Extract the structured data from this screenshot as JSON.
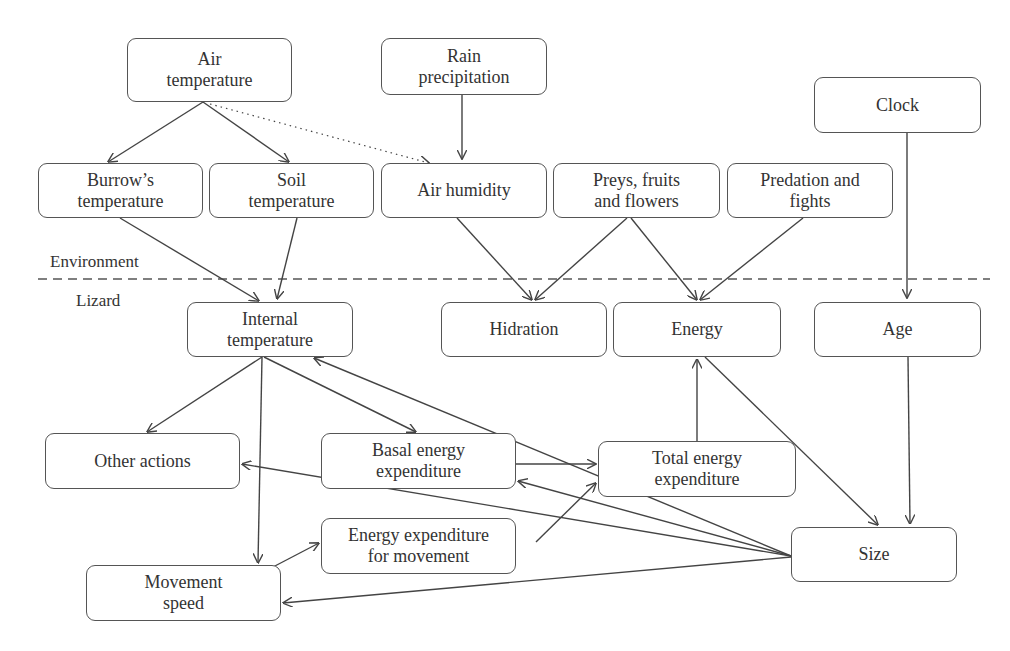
{
  "zones": {
    "environment_label": "Environment",
    "lizard_label": "Lizard"
  },
  "nodes": [
    {
      "id": "air_temperature",
      "label": "Air\ntemperature",
      "x": 127,
      "y": 38,
      "w": 165,
      "h": 64
    },
    {
      "id": "rain_precipitation",
      "label": "Rain\nprecipitation",
      "x": 381,
      "y": 38,
      "w": 166,
      "h": 57
    },
    {
      "id": "clock",
      "label": "Clock",
      "x": 814,
      "y": 77,
      "w": 167,
      "h": 56
    },
    {
      "id": "burrows_temperature",
      "label": "Burrow’s\ntemperature",
      "x": 38,
      "y": 163,
      "w": 165,
      "h": 55
    },
    {
      "id": "soil_temperature",
      "label": "Soil\ntemperature",
      "x": 209,
      "y": 163,
      "w": 165,
      "h": 55
    },
    {
      "id": "air_humidity",
      "label": "Air humidity",
      "x": 381,
      "y": 163,
      "w": 166,
      "h": 55
    },
    {
      "id": "preys_fruits_flowers",
      "label": "Preys, fruits\nand flowers",
      "x": 553,
      "y": 163,
      "w": 167,
      "h": 55
    },
    {
      "id": "predation_fights",
      "label": "Predation and\nfights",
      "x": 727,
      "y": 163,
      "w": 166,
      "h": 55
    },
    {
      "id": "internal_temperature",
      "label": "Internal\ntemperature",
      "x": 187,
      "y": 302,
      "w": 166,
      "h": 55
    },
    {
      "id": "hidration",
      "label": "Hidration",
      "x": 441,
      "y": 302,
      "w": 166,
      "h": 55
    },
    {
      "id": "energy",
      "label": "Energy",
      "x": 613,
      "y": 302,
      "w": 168,
      "h": 55
    },
    {
      "id": "age",
      "label": "Age",
      "x": 814,
      "y": 302,
      "w": 167,
      "h": 55
    },
    {
      "id": "other_actions",
      "label": "Other actions",
      "x": 45,
      "y": 433,
      "w": 195,
      "h": 56
    },
    {
      "id": "basal_energy_expenditure",
      "label": "Basal energy\nexpenditure",
      "x": 321,
      "y": 433,
      "w": 195,
      "h": 56
    },
    {
      "id": "total_energy_expenditure",
      "label": "Total energy\nexpenditure",
      "x": 598,
      "y": 441,
      "w": 198,
      "h": 56
    },
    {
      "id": "energy_expenditure_movement",
      "label": "Energy expenditure\nfor movement",
      "x": 321,
      "y": 518,
      "w": 195,
      "h": 56
    },
    {
      "id": "movement_speed",
      "label": "Movement\nspeed",
      "x": 86,
      "y": 565,
      "w": 195,
      "h": 56
    },
    {
      "id": "size",
      "label": "Size",
      "x": 791,
      "y": 527,
      "w": 166,
      "h": 55
    }
  ],
  "edges": [
    {
      "from": "air_temperature",
      "to": "burrows_temperature",
      "style": "solid",
      "points": [
        [
          203,
          102
        ],
        [
          108,
          162
        ]
      ]
    },
    {
      "from": "air_temperature",
      "to": "soil_temperature",
      "style": "solid",
      "points": [
        [
          203,
          102
        ],
        [
          289,
          162
        ]
      ]
    },
    {
      "from": "air_temperature",
      "to": "air_humidity",
      "style": "dotted",
      "points": [
        [
          210,
          104
        ],
        [
          429,
          163
        ]
      ]
    },
    {
      "from": "rain_precipitation",
      "to": "air_humidity",
      "style": "solid",
      "points": [
        [
          462,
          95
        ],
        [
          462,
          159
        ]
      ]
    },
    {
      "from": "burrows_temperature",
      "to": "internal_temperature",
      "style": "solid",
      "points": [
        [
          120,
          218
        ],
        [
          259,
          301
        ]
      ]
    },
    {
      "from": "soil_temperature",
      "to": "internal_temperature",
      "style": "solid",
      "points": [
        [
          297,
          218
        ],
        [
          277,
          299
        ]
      ]
    },
    {
      "from": "air_humidity",
      "to": "hidration",
      "style": "solid",
      "points": [
        [
          457,
          218
        ],
        [
          532,
          300
        ]
      ]
    },
    {
      "from": "preys_fruits_flowers",
      "to": "hidration",
      "style": "solid",
      "points": [
        [
          627,
          218
        ],
        [
          535,
          300
        ]
      ]
    },
    {
      "from": "preys_fruits_flowers",
      "to": "energy",
      "style": "solid",
      "points": [
        [
          631,
          218
        ],
        [
          697,
          300
        ]
      ]
    },
    {
      "from": "predation_fights",
      "to": "energy",
      "style": "solid",
      "points": [
        [
          803,
          218
        ],
        [
          700,
          300
        ]
      ]
    },
    {
      "from": "clock",
      "to": "age",
      "style": "solid",
      "points": [
        [
          907,
          133
        ],
        [
          907,
          298
        ]
      ]
    },
    {
      "from": "internal_temperature",
      "to": "other_actions",
      "style": "solid",
      "points": [
        [
          262,
          357
        ],
        [
          147,
          432
        ]
      ]
    },
    {
      "from": "internal_temperature",
      "to": "movement_speed",
      "style": "solid",
      "points": [
        [
          262,
          357
        ],
        [
          258,
          563
        ]
      ]
    },
    {
      "from": "internal_temperature",
      "to": "basal_energy_expenditure",
      "style": "solid",
      "points": [
        [
          264,
          357
        ],
        [
          416,
          432
        ]
      ]
    },
    {
      "from": "size",
      "to": "internal_temperature",
      "style": "solid",
      "points": [
        [
          791,
          556
        ],
        [
          314,
          358
        ]
      ]
    },
    {
      "from": "energy",
      "to": "size",
      "style": "solid",
      "points": [
        [
          705,
          357
        ],
        [
          878,
          525
        ]
      ]
    },
    {
      "from": "age",
      "to": "size",
      "style": "solid",
      "points": [
        [
          908,
          357
        ],
        [
          910,
          524
        ]
      ]
    },
    {
      "from": "total_energy_expenditure",
      "to": "energy",
      "style": "solid",
      "points": [
        [
          697,
          441
        ],
        [
          697,
          359
        ]
      ]
    },
    {
      "from": "basal_energy_expenditure",
      "to": "total_energy_expenditure",
      "style": "solid",
      "points": [
        [
          516,
          464
        ],
        [
          596,
          464
        ]
      ]
    },
    {
      "from": "size",
      "to": "basal_energy_expenditure",
      "style": "solid",
      "points": [
        [
          791,
          556
        ],
        [
          518,
          481
        ]
      ]
    },
    {
      "from": "size",
      "to": "other_actions",
      "style": "solid",
      "points": [
        [
          791,
          556
        ],
        [
          242,
          464
        ]
      ]
    },
    {
      "from": "energy_expenditure_movement",
      "to": "total_energy_expenditure",
      "style": "solid",
      "points": [
        [
          536,
          542
        ],
        [
          596,
          483
        ]
      ]
    },
    {
      "from": "movement_speed",
      "to": "energy_expenditure_movement",
      "style": "solid",
      "points": [
        [
          273,
          567
        ],
        [
          319,
          543
        ]
      ]
    },
    {
      "from": "size",
      "to": "movement_speed",
      "style": "solid",
      "points": [
        [
          791,
          557
        ],
        [
          283,
          603
        ]
      ]
    }
  ],
  "separator": {
    "y": 279,
    "x1": 38,
    "x2": 990
  }
}
